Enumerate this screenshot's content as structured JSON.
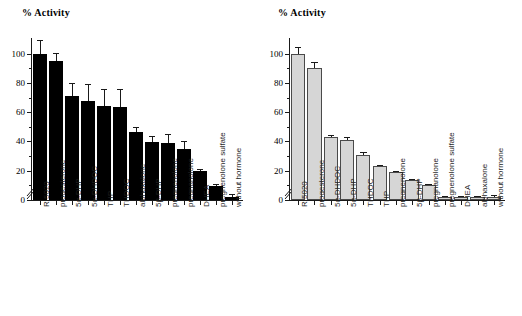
{
  "figure": {
    "panel_count": 2,
    "background": "#ffffff"
  },
  "chart_data": [
    {
      "type": "bar",
      "panel": "left",
      "title": "% Activity",
      "xlabel": "",
      "ylabel": "% Activity",
      "ylim": [
        0,
        108
      ],
      "yticks": [
        0,
        20,
        40,
        60,
        80,
        100
      ],
      "ytick_labels": [
        "0",
        "20",
        "40",
        "60",
        "80",
        "100"
      ],
      "yminor_step": 10,
      "grid": false,
      "legend": "none",
      "axis_break": true,
      "bar_color": "#000000",
      "bar_edge_color": "#000000",
      "error_bars": "upper-only",
      "categories": [
        "R 5020",
        "progesterone",
        "5α-DHP",
        "5α-DHDOC",
        "THP",
        "THDOC",
        "alphaxalone",
        "5β-DHP",
        "pregnenolone",
        "pregnanolone",
        "DHEA",
        "pregnenolone sulfate",
        "without hormone"
      ],
      "values": [
        100.0,
        95.2,
        71.0,
        68.0,
        64.3,
        63.5,
        46.5,
        39.5,
        38.7,
        34.7,
        19.5,
        9.6,
        2.0
      ],
      "errors": [
        9.5,
        5.0,
        8.7,
        11.5,
        11.8,
        12.5,
        3.5,
        4.2,
        6.5,
        5.8,
        1.5,
        1.5,
        1.8
      ]
    },
    {
      "type": "bar",
      "panel": "right",
      "title": "% Activity",
      "xlabel": "",
      "ylabel": "% Activity",
      "ylim": [
        0,
        108
      ],
      "yticks": [
        0,
        20,
        40,
        60,
        80,
        100
      ],
      "ytick_labels": [
        "0",
        "20",
        "40",
        "60",
        "80",
        "100"
      ],
      "yminor_step": 10,
      "grid": false,
      "legend": "none",
      "axis_break": true,
      "bar_color": "#d6d6d6",
      "bar_edge_color": "#4a4a4a",
      "error_bars": "upper-only",
      "categories": [
        "R 5020",
        "progesterone",
        "5α-DHDOC",
        "5α-DHP",
        "THDOC",
        "THP",
        "pregnenolone",
        "5β-DHP",
        "pregnanolone",
        "pregnenolone sulfate",
        "DHEA",
        "alphaxalone",
        "without hormone"
      ],
      "values": [
        100.0,
        90.0,
        42.8,
        41.0,
        31.0,
        23.3,
        19.0,
        13.8,
        10.0,
        2.0,
        2.0,
        2.0,
        2.2
      ],
      "errors": [
        4.5,
        4.0,
        1.6,
        2.0,
        1.5,
        0.8,
        0.8,
        0.7,
        0.6,
        0.6,
        0.6,
        0.6,
        1.5
      ]
    }
  ]
}
